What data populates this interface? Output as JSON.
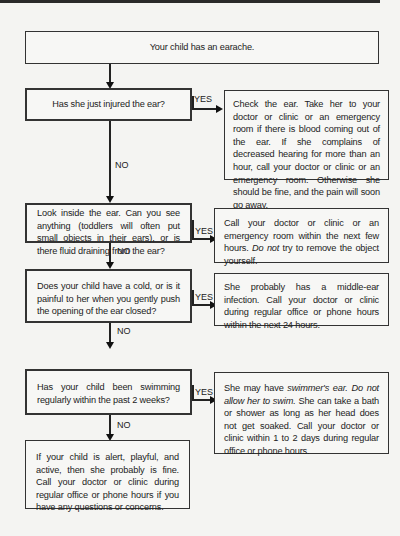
{
  "start": {
    "text": "Your child has an earache."
  },
  "labels": {
    "yes": "YES",
    "no": "NO"
  },
  "questions": [
    {
      "text": "Has she just injured the ear?"
    },
    {
      "text": "Look inside the ear. Can you see anything (toddlers will often put small objects in their ears), or is there fluid draining from the ear?"
    },
    {
      "text": "Does your child have a cold, or is it painful to her when you gently push the opening of the ear closed?"
    },
    {
      "text": "Has your child been swimming regularly within the past 2 weeks?"
    }
  ],
  "answers": [
    {
      "text": "Check the ear. Take her to your doctor or clinic or an emergency room if there is blood coming out of the ear. If she complains of decreased hearing for more than an hour, call your doctor or clinic or an emergency room. Otherwise she should be fine, and the pain will soon go away."
    },
    {
      "part1": "Call your doctor or clinic or an emergency room within the next few hours. ",
      "italic": "Do not",
      "part2": " try to remove the object yourself."
    },
    {
      "text": "She probably has a middle-ear infection. Call your doctor or clinic during regular office or phone hours within the next 24 hours."
    },
    {
      "part1": "She may have ",
      "italic1": "swimmer's ear. Do not allow her to swim.",
      "part2": " She can take a bath or shower as long as her head does not get soaked. Call your doctor or clinic within 1 to 2 days during regular office or phone hours."
    }
  ],
  "final": {
    "text": "If your child is alert, playful, and active, then she probably is fine. Call your doctor or clinic during regular office or phone hours if you have any questions or concerns."
  }
}
